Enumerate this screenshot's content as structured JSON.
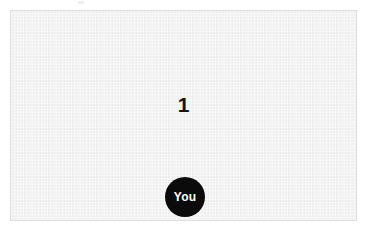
{
  "app": {
    "name": "game-canvas",
    "background_color": "#ffffff"
  },
  "playfield": {
    "name": "playfield",
    "background_color": "#f1f1f1",
    "border_color": "#dedede",
    "width_px": 347,
    "height_px": 211
  },
  "score": {
    "label": "1",
    "value": 1,
    "color": "#141414"
  },
  "player": {
    "label": "You",
    "shape": "circle",
    "fill_color": "#0b0b0b",
    "text_color": "#ffffff",
    "diameter_px": 40
  }
}
